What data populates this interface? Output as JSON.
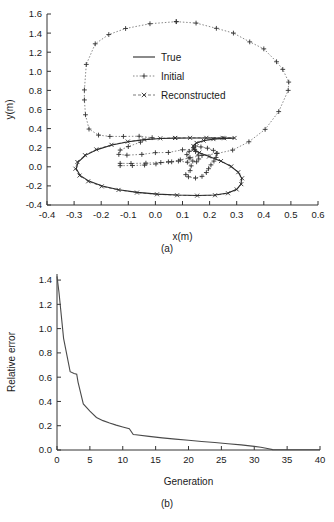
{
  "figure": {
    "panel_a_caption": "(a)",
    "panel_b_caption": "(b)"
  },
  "chart_data": [
    {
      "id": "panel-a",
      "type": "line",
      "title": "",
      "xlabel": "x(m)",
      "ylabel": "y(m)",
      "xlim": [
        -0.4,
        0.6
      ],
      "ylim": [
        -0.4,
        1.6
      ],
      "xticks": [
        "-0.4",
        "-0.3",
        "-0.2",
        "-0.1",
        "0.0",
        "0.1",
        "0.2",
        "0.3",
        "0.4",
        "0.5",
        "0.6"
      ],
      "xtick_values": [
        -0.4,
        -0.3,
        -0.2,
        -0.1,
        0.0,
        0.1,
        0.2,
        0.3,
        0.4,
        0.5,
        0.6
      ],
      "yticks": [
        "-0.4",
        "-0.2",
        "0.0",
        "0.2",
        "0.4",
        "0.6",
        "0.8",
        "1.0",
        "1.2",
        "1.4",
        "1.6"
      ],
      "ytick_values": [
        -0.4,
        -0.2,
        0.0,
        0.2,
        0.4,
        0.6,
        0.8,
        1.0,
        1.2,
        1.4,
        1.6
      ],
      "grid": false,
      "legend_position": "center",
      "legend": [
        {
          "label": "True",
          "style": "solid",
          "marker": "none"
        },
        {
          "label": "Initial",
          "style": "dotted",
          "marker": "plus"
        },
        {
          "label": "Reconstructed",
          "style": "dashed",
          "marker": "cross"
        }
      ],
      "series": [
        {
          "name": "True",
          "style": "solid",
          "marker": "none",
          "points": [
            [
              0.073,
              0.3
            ],
            [
              0.02,
              0.296
            ],
            [
              -0.04,
              0.285
            ],
            [
              -0.1,
              0.262
            ],
            [
              -0.16,
              0.228
            ],
            [
              -0.215,
              0.18
            ],
            [
              -0.258,
              0.12
            ],
            [
              -0.285,
              0.05
            ],
            [
              -0.292,
              -0.02
            ],
            [
              -0.278,
              -0.09
            ],
            [
              -0.245,
              -0.15
            ],
            [
              -0.196,
              -0.202
            ],
            [
              -0.135,
              -0.24
            ],
            [
              -0.066,
              -0.268
            ],
            [
              0.008,
              -0.286
            ],
            [
              0.082,
              -0.296
            ],
            [
              0.155,
              -0.3
            ],
            [
              0.22,
              -0.296
            ],
            [
              0.268,
              -0.275
            ],
            [
              0.3,
              -0.235
            ],
            [
              0.316,
              -0.18
            ],
            [
              0.318,
              -0.118
            ],
            [
              0.305,
              -0.055
            ],
            [
              0.278,
              0.005
            ],
            [
              0.24,
              0.062
            ],
            [
              0.196,
              0.11
            ],
            [
              0.16,
              0.15
            ],
            [
              0.14,
              0.185
            ],
            [
              0.138,
              0.218
            ],
            [
              0.15,
              0.248
            ],
            [
              0.176,
              0.272
            ],
            [
              0.212,
              0.288
            ],
            [
              0.253,
              0.297
            ],
            [
              0.29,
              0.3
            ],
            [
              0.25,
              0.3
            ],
            [
              0.19,
              0.301
            ],
            [
              0.13,
              0.301
            ],
            [
              0.073,
              0.3
            ]
          ]
        },
        {
          "name": "Initial",
          "style": "dotted",
          "marker": "plus",
          "points": [
            [
              0.077,
              1.52
            ],
            [
              0.15,
              1.505
            ],
            [
              0.225,
              1.45
            ],
            [
              0.288,
              1.4
            ],
            [
              0.348,
              1.308
            ],
            [
              0.4,
              1.235
            ],
            [
              0.447,
              1.1
            ],
            [
              0.47,
              1.02
            ],
            [
              0.492,
              0.887
            ],
            [
              0.49,
              0.8
            ],
            [
              0.455,
              0.578
            ],
            [
              0.405,
              0.392
            ],
            [
              0.345,
              0.262
            ],
            [
              0.285,
              0.175
            ],
            [
              0.228,
              0.14
            ],
            [
              0.172,
              0.118
            ],
            [
              0.128,
              0.095
            ],
            [
              0.092,
              0.072
            ],
            [
              0.06,
              0.052
            ],
            [
              0.02,
              0.045
            ],
            [
              -0.035,
              0.038
            ],
            [
              -0.09,
              0.035
            ],
            [
              -0.13,
              0.036
            ],
            [
              -0.13,
              0.012
            ],
            [
              -0.085,
              0.013
            ],
            [
              -0.04,
              0.018
            ],
            [
              0.002,
              0.03
            ],
            [
              0.048,
              0.052
            ],
            [
              0.085,
              0.06
            ],
            [
              0.118,
              0.048
            ],
            [
              0.132,
              0.01
            ],
            [
              0.128,
              -0.04
            ],
            [
              0.112,
              -0.082
            ],
            [
              0.122,
              -0.105
            ],
            [
              0.148,
              -0.118
            ],
            [
              0.172,
              -0.1
            ],
            [
              0.188,
              -0.06
            ],
            [
              0.196,
              -0.02
            ],
            [
              0.205,
              0.02
            ],
            [
              0.216,
              0.06
            ],
            [
              0.224,
              0.098
            ],
            [
              0.225,
              0.14
            ],
            [
              0.214,
              0.172
            ],
            [
              0.192,
              0.195
            ],
            [
              0.168,
              0.208
            ],
            [
              0.148,
              0.218
            ],
            [
              0.142,
              0.198
            ],
            [
              0.148,
              0.16
            ],
            [
              0.158,
              0.122
            ],
            [
              0.16,
              0.082
            ],
            [
              0.152,
              0.052
            ],
            [
              0.138,
              0.06
            ],
            [
              0.124,
              0.092
            ],
            [
              0.116,
              0.128
            ],
            [
              0.125,
              0.162
            ],
            [
              0.145,
              0.182
            ],
            [
              0.1,
              0.178
            ],
            [
              0.048,
              0.15
            ],
            [
              0.0,
              0.148
            ],
            [
              -0.05,
              0.13
            ],
            [
              -0.105,
              0.122
            ],
            [
              -0.135,
              0.13
            ],
            [
              -0.13,
              0.175
            ],
            [
              -0.1,
              0.212
            ],
            [
              -0.055,
              0.258
            ],
            [
              -0.012,
              0.305
            ],
            [
              -0.06,
              0.32
            ],
            [
              -0.118,
              0.318
            ],
            [
              -0.168,
              0.318
            ],
            [
              -0.21,
              0.332
            ],
            [
              -0.245,
              0.395
            ],
            [
              -0.258,
              0.545
            ],
            [
              -0.262,
              0.7
            ],
            [
              -0.262,
              0.805
            ],
            [
              -0.255,
              1.072
            ],
            [
              -0.222,
              1.288
            ],
            [
              -0.172,
              1.385
            ],
            [
              -0.11,
              1.448
            ],
            [
              -0.02,
              1.498
            ],
            [
              0.077,
              1.52
            ]
          ]
        },
        {
          "name": "Reconstructed",
          "style": "dashed",
          "marker": "cross",
          "points": [
            [
              0.073,
              0.302
            ],
            [
              0.018,
              0.298
            ],
            [
              -0.042,
              0.286
            ],
            [
              -0.102,
              0.264
            ],
            [
              -0.162,
              0.23
            ],
            [
              -0.218,
              0.182
            ],
            [
              -0.26,
              0.122
            ],
            [
              -0.288,
              0.05
            ],
            [
              -0.295,
              -0.02
            ],
            [
              -0.28,
              -0.092
            ],
            [
              -0.248,
              -0.152
            ],
            [
              -0.198,
              -0.205
            ],
            [
              -0.136,
              -0.242
            ],
            [
              -0.068,
              -0.27
            ],
            [
              0.006,
              -0.288
            ],
            [
              0.08,
              -0.298
            ],
            [
              0.154,
              -0.302
            ],
            [
              0.22,
              -0.298
            ],
            [
              0.268,
              -0.277
            ],
            [
              0.3,
              -0.237
            ],
            [
              0.317,
              -0.182
            ],
            [
              0.32,
              -0.12
            ],
            [
              0.306,
              -0.056
            ],
            [
              0.28,
              0.004
            ],
            [
              0.242,
              0.06
            ],
            [
              0.198,
              0.108
            ],
            [
              0.162,
              0.148
            ],
            [
              0.142,
              0.184
            ],
            [
              0.14,
              0.218
            ],
            [
              0.152,
              0.25
            ],
            [
              0.178,
              0.274
            ],
            [
              0.214,
              0.29
            ],
            [
              0.254,
              0.299
            ],
            [
              0.292,
              0.302
            ],
            [
              0.248,
              0.303
            ],
            [
              0.188,
              0.303
            ],
            [
              0.128,
              0.303
            ],
            [
              0.073,
              0.302
            ]
          ]
        }
      ]
    },
    {
      "id": "panel-b",
      "type": "line",
      "title": "",
      "xlabel": "Generation",
      "ylabel": "Relative error",
      "xlim": [
        0,
        40
      ],
      "ylim": [
        0.0,
        1.45
      ],
      "xticks": [
        "0",
        "5",
        "10",
        "15",
        "20",
        "25",
        "30",
        "35",
        "40"
      ],
      "xtick_values": [
        0,
        5,
        10,
        15,
        20,
        25,
        30,
        35,
        40
      ],
      "yticks": [
        "0.0",
        "0.2",
        "0.4",
        "0.6",
        "0.8",
        "1.0",
        "1.2",
        "1.4"
      ],
      "ytick_values": [
        0.0,
        0.2,
        0.4,
        0.6,
        0.8,
        1.0,
        1.2,
        1.4
      ],
      "grid": false,
      "legend_position": "none",
      "legend": [],
      "series": [
        {
          "name": "Relative error",
          "style": "solid",
          "marker": "none",
          "x": [
            0,
            0.3,
            1,
            2,
            2.6,
            3,
            3.2,
            4,
            5,
            6,
            7,
            8,
            9,
            10,
            11,
            11.6,
            12,
            14,
            16,
            18,
            20,
            22,
            24,
            26,
            28,
            30,
            31,
            32,
            32.8,
            34,
            36,
            38,
            40
          ],
          "y": [
            1.43,
            1.3,
            0.92,
            0.645,
            0.63,
            0.625,
            0.56,
            0.38,
            0.32,
            0.268,
            0.242,
            0.222,
            0.205,
            0.19,
            0.175,
            0.128,
            0.125,
            0.112,
            0.1,
            0.09,
            0.08,
            0.07,
            0.062,
            0.052,
            0.042,
            0.03,
            0.022,
            0.012,
            0.003,
            0.002,
            0.002,
            0.002,
            0.002
          ]
        }
      ]
    }
  ]
}
